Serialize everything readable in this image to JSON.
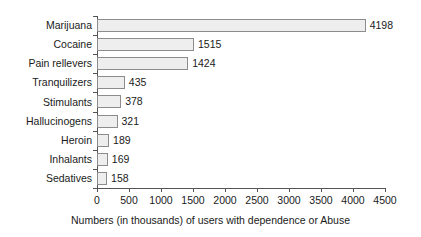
{
  "chart_data": {
    "type": "bar",
    "orientation": "horizontal",
    "title": "",
    "xlabel": "Numbers (in thousands) of users with dependence or Abuse",
    "ylabel": "",
    "categories": [
      "Marijuana",
      "Cocaine",
      "Pain rellevers",
      "Tranquilizers",
      "Stimulants",
      "Hallucinogens",
      "Heroin",
      "Inhalants",
      "Sedatives"
    ],
    "values": [
      4198,
      1515,
      1424,
      435,
      378,
      321,
      189,
      169,
      158
    ],
    "value_labels": [
      "4198",
      "1515",
      "1424",
      "435",
      "378",
      "321",
      "189",
      "169",
      "158"
    ],
    "xlim": [
      0,
      4500
    ],
    "xticks": [
      0,
      500,
      1000,
      1500,
      2000,
      2500,
      3000,
      3500,
      4000,
      4500
    ],
    "xtick_labels": [
      "0",
      "500",
      "1000",
      "1500",
      "2000",
      "2500",
      "3000",
      "3500",
      "4000",
      "4500"
    ],
    "grid": false,
    "legend": null,
    "bar_fill_color": "#eeeeee",
    "bar_border_color": "#8c8c8c",
    "axis_color": "#555555",
    "text_color": "#1a1a1a",
    "background_color": "#ffffff"
  }
}
